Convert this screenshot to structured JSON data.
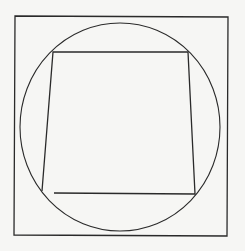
{
  "diagram": {
    "colors": {
      "background": "#f6f6f4",
      "stroke": "#2a2a2a"
    },
    "outer_square": {
      "points": "15,16 228,17 227,236 14,235"
    },
    "circle": {
      "cx": 120,
      "cy": 127,
      "rx": 100,
      "ry": 104
    },
    "quadrilateral_path": "M 54,193 L 195,194 L 188,52 L 53,52 L 42,191"
  }
}
